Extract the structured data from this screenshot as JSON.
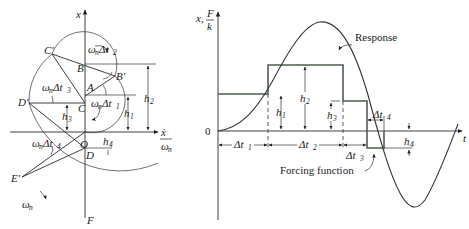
{
  "left_diagram": {
    "axes": {
      "vertical_label": "x",
      "horizontal_label_num": "ẋ",
      "horizontal_label_den": "ω",
      "horizontal_label_den_sub": "n"
    },
    "points": {
      "O": "O",
      "A": "A",
      "B": "B",
      "B_prime": "B′",
      "C": "C",
      "C_prime": "C′",
      "D": "D",
      "D_prime": "D′",
      "E_prime": "E′",
      "F": "F"
    },
    "angles": {
      "t1": {
        "omega": "ω",
        "sub": "n",
        "delta": "Δt",
        "idx": "1"
      },
      "t2": {
        "omega": "ω",
        "sub": "n",
        "delta": "Δt",
        "idx": "2"
      },
      "t3": {
        "omega": "ω",
        "sub": "n",
        "delta": "Δt",
        "idx": "3"
      },
      "t4": {
        "omega": "ω",
        "sub": "n",
        "delta": "Δt",
        "idx": "4"
      }
    },
    "heights": {
      "h1": {
        "h": "h",
        "idx": "1"
      },
      "h2": {
        "h": "h",
        "idx": "2"
      },
      "h3": {
        "h": "h",
        "idx": "3"
      },
      "h4": {
        "h": "h",
        "idx": "4"
      }
    },
    "rotation": {
      "omega": "ω",
      "sub": "n"
    }
  },
  "right_diagram": {
    "y_axis_label": "x,",
    "y_axis_frac_num": "F",
    "y_axis_frac_den": "k",
    "x_axis_label": "t",
    "origin_label": "0",
    "response_label": "Response",
    "forcing_label": "Forcing function",
    "intervals": [
      {
        "delta": "Δt",
        "idx": "1"
      },
      {
        "delta": "Δt",
        "idx": "2"
      },
      {
        "delta": "Δt",
        "idx": "3"
      },
      {
        "delta": "Δt",
        "idx": "4"
      }
    ],
    "heights": [
      {
        "h": "h",
        "idx": "1"
      },
      {
        "h": "h",
        "idx": "2"
      },
      {
        "h": "h",
        "idx": "3"
      },
      {
        "h": "h",
        "idx": "4"
      }
    ]
  },
  "colors": {
    "ink": "#2a2a2a",
    "forcing": "#4e5e4e",
    "background": "#ffffff"
  }
}
